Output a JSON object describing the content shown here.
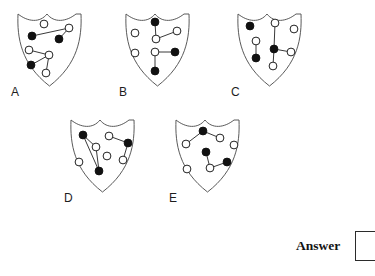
{
  "page": {
    "background_color": "#ffffff",
    "width": 373,
    "height": 276,
    "kind": "multiple-choice-figure-puzzle"
  },
  "style": {
    "shield_outline_color": "#5a5a5a",
    "shield_fill_color": "#ffffff",
    "edge_color": "#3a3a3a",
    "node_filled_color": "#111111",
    "node_hollow_fill": "#ffffff",
    "node_outline_color": "#222222",
    "node_radius": 3.9,
    "edge_width": 1.0,
    "shield_stroke_width": 1.0
  },
  "answer": {
    "label": "Answer",
    "value": "",
    "box_placeholder": ""
  },
  "options": [
    {
      "id": "A",
      "label": "A",
      "position": {
        "x": 14,
        "y": 8
      },
      "label_position": {
        "x": 11,
        "y": 86
      },
      "nodes": [
        {
          "id": "a1",
          "x": 30,
          "y": 16,
          "fill": "hollow"
        },
        {
          "id": "a2",
          "x": 55,
          "y": 20,
          "fill": "hollow"
        },
        {
          "id": "a3",
          "x": 18,
          "y": 28,
          "fill": "filled"
        },
        {
          "id": "a4",
          "x": 45,
          "y": 31,
          "fill": "filled"
        },
        {
          "id": "a5",
          "x": 15,
          "y": 42,
          "fill": "hollow"
        },
        {
          "id": "a6",
          "x": 35,
          "y": 47,
          "fill": "hollow"
        },
        {
          "id": "a7",
          "x": 17,
          "y": 57,
          "fill": "filled"
        },
        {
          "id": "a8",
          "x": 32,
          "y": 65,
          "fill": "hollow"
        }
      ],
      "edges": [
        [
          "a3",
          "a2"
        ],
        [
          "a2",
          "a4"
        ],
        [
          "a5",
          "a6"
        ],
        [
          "a6",
          "a7"
        ],
        [
          "a6",
          "a8"
        ]
      ]
    },
    {
      "id": "B",
      "label": "B",
      "position": {
        "x": 122,
        "y": 8
      },
      "label_position": {
        "x": 119,
        "y": 86
      },
      "nodes": [
        {
          "id": "b1",
          "x": 33,
          "y": 14,
          "fill": "filled"
        },
        {
          "id": "b2",
          "x": 13,
          "y": 25,
          "fill": "hollow"
        },
        {
          "id": "b3",
          "x": 55,
          "y": 23,
          "fill": "hollow"
        },
        {
          "id": "b4",
          "x": 34,
          "y": 31,
          "fill": "hollow"
        },
        {
          "id": "b5",
          "x": 13,
          "y": 45,
          "fill": "hollow"
        },
        {
          "id": "b6",
          "x": 33,
          "y": 44,
          "fill": "hollow"
        },
        {
          "id": "b7",
          "x": 53,
          "y": 44,
          "fill": "filled"
        },
        {
          "id": "b8",
          "x": 33,
          "y": 63,
          "fill": "filled"
        }
      ],
      "edges": [
        [
          "b1",
          "b4"
        ],
        [
          "b4",
          "b3"
        ],
        [
          "b6",
          "b7"
        ],
        [
          "b6",
          "b8"
        ]
      ]
    },
    {
      "id": "C",
      "label": "C",
      "position": {
        "x": 234,
        "y": 8
      },
      "label_position": {
        "x": 231,
        "y": 86
      },
      "nodes": [
        {
          "id": "c1",
          "x": 16,
          "y": 18,
          "fill": "filled"
        },
        {
          "id": "c2",
          "x": 41,
          "y": 15,
          "fill": "hollow"
        },
        {
          "id": "c3",
          "x": 60,
          "y": 21,
          "fill": "hollow"
        },
        {
          "id": "c4",
          "x": 22,
          "y": 33,
          "fill": "hollow"
        },
        {
          "id": "c5",
          "x": 40,
          "y": 41,
          "fill": "filled"
        },
        {
          "id": "c6",
          "x": 57,
          "y": 44,
          "fill": "hollow"
        },
        {
          "id": "c7",
          "x": 22,
          "y": 50,
          "fill": "filled"
        },
        {
          "id": "c8",
          "x": 39,
          "y": 58,
          "fill": "hollow"
        }
      ],
      "edges": [
        [
          "c2",
          "c5"
        ],
        [
          "c4",
          "c7"
        ],
        [
          "c5",
          "c6"
        ],
        [
          "c5",
          "c8"
        ]
      ]
    },
    {
      "id": "D",
      "label": "D",
      "position": {
        "x": 67,
        "y": 114
      },
      "label_position": {
        "x": 64,
        "y": 192
      },
      "nodes": [
        {
          "id": "d1",
          "x": 16,
          "y": 21,
          "fill": "filled"
        },
        {
          "id": "d2",
          "x": 42,
          "y": 22,
          "fill": "hollow"
        },
        {
          "id": "d3",
          "x": 61,
          "y": 29,
          "fill": "filled"
        },
        {
          "id": "d4",
          "x": 29,
          "y": 33,
          "fill": "hollow"
        },
        {
          "id": "d5",
          "x": 40,
          "y": 42,
          "fill": "hollow"
        },
        {
          "id": "d6",
          "x": 56,
          "y": 46,
          "fill": "hollow"
        },
        {
          "id": "d7",
          "x": 12,
          "y": 48,
          "fill": "hollow"
        },
        {
          "id": "d8",
          "x": 32,
          "y": 57,
          "fill": "filled"
        }
      ],
      "edges": [
        [
          "d1",
          "d4"
        ],
        [
          "d1",
          "d8"
        ],
        [
          "d4",
          "d8"
        ],
        [
          "d2",
          "d3"
        ],
        [
          "d3",
          "d6"
        ]
      ]
    },
    {
      "id": "E",
      "label": "E",
      "position": {
        "x": 172,
        "y": 114
      },
      "label_position": {
        "x": 169,
        "y": 192
      },
      "nodes": [
        {
          "id": "e1",
          "x": 31,
          "y": 17,
          "fill": "filled"
        },
        {
          "id": "e2",
          "x": 48,
          "y": 24,
          "fill": "hollow"
        },
        {
          "id": "e3",
          "x": 14,
          "y": 30,
          "fill": "hollow"
        },
        {
          "id": "e4",
          "x": 62,
          "y": 31,
          "fill": "hollow"
        },
        {
          "id": "e5",
          "x": 34,
          "y": 38,
          "fill": "filled"
        },
        {
          "id": "e6",
          "x": 55,
          "y": 48,
          "fill": "filled"
        },
        {
          "id": "e7",
          "x": 15,
          "y": 55,
          "fill": "hollow"
        },
        {
          "id": "e8",
          "x": 38,
          "y": 54,
          "fill": "hollow"
        }
      ],
      "edges": [
        [
          "e1",
          "e2"
        ],
        [
          "e1",
          "e3"
        ],
        [
          "e5",
          "e8"
        ],
        [
          "e8",
          "e6"
        ]
      ]
    }
  ]
}
